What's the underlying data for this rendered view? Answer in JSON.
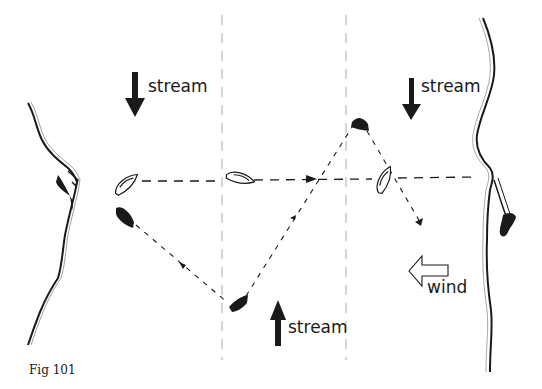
{
  "figure": {
    "caption": "Fig 101",
    "labels": {
      "stream_top_left": "stream",
      "stream_top_right": "stream",
      "stream_bottom": "stream",
      "wind": "wind"
    },
    "stream_arrows": [
      {
        "position": "top-left",
        "direction": "down"
      },
      {
        "position": "top-right",
        "direction": "down"
      },
      {
        "position": "bottom-center",
        "direction": "up"
      }
    ],
    "wind_arrow": {
      "direction": "left",
      "style": "outline"
    },
    "boats": [
      {
        "id": "white-boat-start",
        "fill": "white",
        "track": "dashed-horizontal"
      },
      {
        "id": "white-boat-mid",
        "fill": "white",
        "track": "dashed-horizontal"
      },
      {
        "id": "white-boat-right",
        "fill": "white",
        "track": "dashed-horizontal"
      },
      {
        "id": "black-boat-start",
        "fill": "black",
        "track": "zig-zag"
      },
      {
        "id": "black-boat-bottom",
        "fill": "black",
        "track": "zig-zag"
      },
      {
        "id": "black-boat-top",
        "fill": "black",
        "track": "zig-zag"
      }
    ],
    "colors": {
      "ink": "#1a1a1a",
      "guide_lines": "#b0b0b0",
      "background": "#ffffff"
    }
  }
}
